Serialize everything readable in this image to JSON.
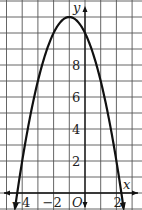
{
  "chart_data": {
    "type": "line",
    "title": "",
    "function": "y = -x^2 - 2x + 10",
    "vertex": [
      -1,
      11
    ],
    "xlabel": "x",
    "ylabel": "y",
    "origin_label": "O",
    "xlim": [
      -5,
      3
    ],
    "ylim": [
      -1,
      12
    ],
    "grid": true,
    "x_tick_labels": [
      {
        "value": -4,
        "text": "−4"
      },
      {
        "value": -2,
        "text": "−2"
      },
      {
        "value": 2,
        "text": "2"
      }
    ],
    "y_tick_labels": [
      {
        "value": 2,
        "text": "2"
      },
      {
        "value": 4,
        "text": "4"
      },
      {
        "value": 6,
        "text": "6"
      },
      {
        "value": 8,
        "text": "8"
      }
    ],
    "series": [
      {
        "name": "parabola",
        "x": [
          -4.4,
          -4,
          -3,
          -2,
          -1,
          0,
          1,
          2,
          2.4
        ],
        "y": [
          -0.76,
          2,
          7,
          10,
          11,
          10,
          7,
          2,
          -0.56
        ]
      }
    ]
  },
  "colors": {
    "grid": "#555555",
    "curve": "#111111",
    "background": "#ffffff"
  }
}
